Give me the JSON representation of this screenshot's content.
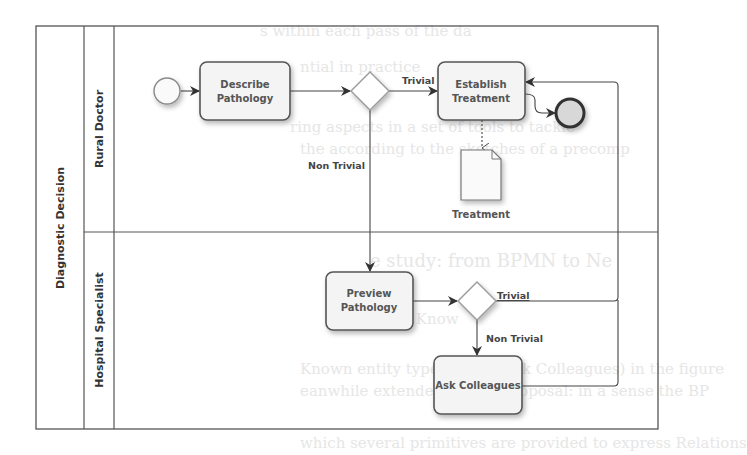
{
  "pool": {
    "title": "Diagnostic Decision"
  },
  "lanes": [
    {
      "name": "Rural Doctor"
    },
    {
      "name": "Hospital Specialist"
    }
  ],
  "tasks": {
    "describe": {
      "line1": "Describe",
      "line2": "Pathology"
    },
    "establish": {
      "line1": "Establish",
      "line2": "Treatment"
    },
    "preview": {
      "line1": "Preview",
      "line2": "Pathology"
    },
    "ask": {
      "line1": "Ask Colleagues"
    }
  },
  "data_object": {
    "label": "Treatment"
  },
  "flows": {
    "trivial_1": "Trivial",
    "non_trivial_1": "Non Trivial",
    "trivial_2": "Trivial",
    "non_trivial_2": "Non Trivial"
  },
  "colors": {
    "stroke": "#4a4a4a",
    "task_fill": "#f4f4f4",
    "gateway_stroke": "#9a9a9a",
    "end_fill": "#d8d8d8"
  }
}
